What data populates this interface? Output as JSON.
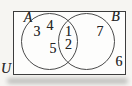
{
  "diagram": {
    "type": "venn-two-sets",
    "universe_label": "U",
    "set_a_label": "A",
    "set_b_label": "B",
    "regions": {
      "a_only": [
        3,
        4,
        5
      ],
      "intersection": [
        1,
        2
      ],
      "b_only": [
        7
      ],
      "outside_sets": [
        6
      ]
    }
  },
  "labels": {
    "u": "U",
    "a": "A",
    "b": "B",
    "n1": "1",
    "n2": "2",
    "n3": "3",
    "n4": "4",
    "n5": "5",
    "n6": "6",
    "n7": "7"
  },
  "colors": {
    "page_background": "#f6f5f2",
    "rect_fill": "#fdfdfc",
    "rect_border": "#3c3c3c",
    "circle_border": "#4a4a4a",
    "text": "#262626"
  }
}
